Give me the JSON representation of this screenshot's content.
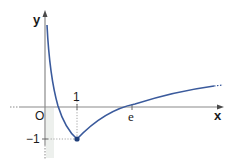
{
  "figure": {
    "type": "function-graph",
    "function_description": "f(x) = |ln x| - 1",
    "axis_labels": {
      "x": "x",
      "y": "y"
    },
    "origin_label": "O",
    "tick_labels": {
      "x_one": "1",
      "x_e": "e",
      "y_minus_one": "−1"
    },
    "minimum_point": {
      "x": 1,
      "y": -1
    },
    "zeros": [
      "1/e",
      "e"
    ],
    "colors": {
      "curve": "#3a5a9c",
      "axes": "#8a8a8a",
      "point": "#1f3f7a",
      "dotted": "#9a9a9a",
      "shading": "#e4e8e4"
    }
  }
}
